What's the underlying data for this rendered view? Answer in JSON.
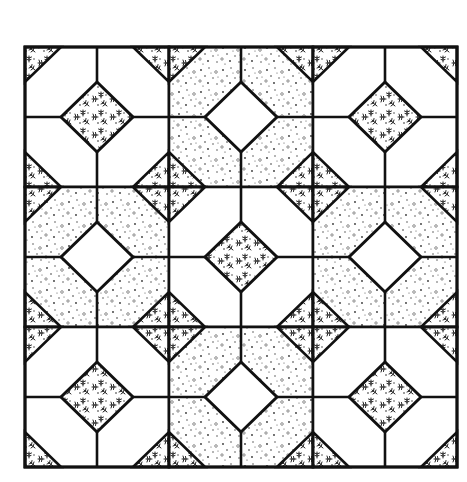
{
  "canvas": {
    "width": 467,
    "height": 482,
    "background": "#ffffff"
  },
  "quilt": {
    "left": 25,
    "top": 47,
    "rows": 3,
    "cols": 3,
    "block_width": 144,
    "block_height": 140,
    "corner_leg_x": 36,
    "corner_leg_y": 35,
    "diamond_half_w": 36,
    "diamond_half_h": 35,
    "line_color": "#111111",
    "line_width": 2.6,
    "border_width": 3
  },
  "fabrics": {
    "white": {
      "name": "plain white",
      "color": "#ffffff"
    },
    "dotted": {
      "name": "dotted print",
      "color": "#ffffff",
      "dot_color": "#333333"
    },
    "floral": {
      "name": "floral sprig print",
      "color": "#ffffff",
      "sprig_color": "#222222"
    }
  },
  "blocks": [
    {
      "row": 0,
      "col": 0,
      "octagon": "white",
      "diamond": "floral",
      "corners": "floral"
    },
    {
      "row": 0,
      "col": 1,
      "octagon": "dotted",
      "diamond": "white",
      "corners": "floral"
    },
    {
      "row": 0,
      "col": 2,
      "octagon": "white",
      "diamond": "floral",
      "corners": "floral"
    },
    {
      "row": 1,
      "col": 0,
      "octagon": "dotted",
      "diamond": "white",
      "corners": "floral"
    },
    {
      "row": 1,
      "col": 1,
      "octagon": "white",
      "diamond": "floral",
      "corners": "floral"
    },
    {
      "row": 1,
      "col": 2,
      "octagon": "dotted",
      "diamond": "white",
      "corners": "floral"
    },
    {
      "row": 2,
      "col": 0,
      "octagon": "white",
      "diamond": "floral",
      "corners": "floral"
    },
    {
      "row": 2,
      "col": 1,
      "octagon": "dotted",
      "diamond": "white",
      "corners": "floral"
    },
    {
      "row": 2,
      "col": 2,
      "octagon": "white",
      "diamond": "floral",
      "corners": "floral"
    }
  ]
}
